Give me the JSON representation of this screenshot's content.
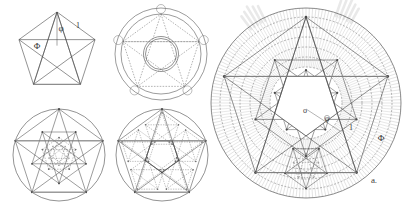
{
  "plate": {
    "title": "Pentagon and pentagram golden-ratio construction plate",
    "background_color": "#ffffff",
    "width": 403,
    "height": 210,
    "ink_color": "#4a4a4a",
    "dashed_color": "#6b6b6b",
    "shade_color": "#b9b9b9",
    "label_color": "#3a3a3a"
  },
  "figures": [
    {
      "id": "fig-top-left",
      "name": "pentagon-with-pentagram",
      "center_x": 57,
      "center_y": 52,
      "radius": 40,
      "has_circumcircle": false,
      "labels": [
        {
          "id": "phi-lower-top-left",
          "text": "φ",
          "x": 61,
          "y": 31,
          "size": 9
        },
        {
          "id": "phi-upper-top-left",
          "text": "Φ",
          "x": 37,
          "y": 49,
          "size": 9
        },
        {
          "id": "one-top-left",
          "text": "1",
          "x": 78,
          "y": 28,
          "size": 8
        }
      ]
    },
    {
      "id": "fig-top-right",
      "name": "concentric-circles-with-dashed-pentagram",
      "center_x": 161,
      "center_y": 54,
      "radius": 46,
      "ring_radii": [
        46,
        40,
        17.5,
        15.5
      ],
      "has_circumcircle": true,
      "labels": []
    },
    {
      "id": "fig-bottom-left",
      "name": "nested-pentagram-lattice",
      "center_x": 59,
      "center_y": 155,
      "radius": 46,
      "has_circumcircle": true,
      "nest_depth": 3,
      "labels": []
    },
    {
      "id": "fig-bottom-middle",
      "name": "pentagram-with-point-subdivisions",
      "center_x": 162,
      "center_y": 155,
      "radius": 46,
      "has_circumcircle": true,
      "nest_depth": 2,
      "labels": []
    },
    {
      "id": "fig-main-right",
      "name": "shaded-radial-pentagram-mandala",
      "center_x": 306,
      "center_y": 103,
      "radius": 95,
      "ring_radii": [
        95,
        86,
        76,
        66,
        56,
        46,
        36
      ],
      "has_circumcircle": true,
      "has_radial_hatching": true,
      "plumes": 2,
      "labels": [
        {
          "id": "center-o",
          "text": "o",
          "x": 305,
          "y": 113,
          "size": 8
        },
        {
          "id": "phi-lower-main",
          "text": "φ",
          "x": 327,
          "y": 121,
          "size": 8
        },
        {
          "id": "one-main",
          "text": "1",
          "x": 351,
          "y": 130,
          "size": 8
        },
        {
          "id": "phi-upper-main",
          "text": "Φ",
          "x": 381,
          "y": 141,
          "size": 9
        },
        {
          "id": "figure-caption-a",
          "text": "a.",
          "x": 374,
          "y": 183,
          "size": 9
        }
      ]
    }
  ],
  "legend": {
    "phi_lower": "φ",
    "phi_upper": "Φ",
    "unit": "1",
    "center_point": "o",
    "caption": "a."
  }
}
